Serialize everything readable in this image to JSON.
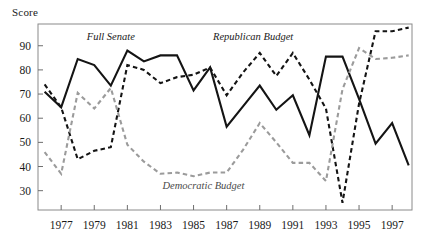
{
  "chart_data": {
    "type": "line",
    "title": "",
    "ylabel": "Score",
    "xlabel": "",
    "ylim": [
      22,
      99
    ],
    "xlim": [
      1975.6,
      1998.2
    ],
    "yticks": [
      30,
      40,
      50,
      60,
      70,
      80,
      90
    ],
    "xticks": [
      1977,
      1979,
      1981,
      1983,
      1985,
      1987,
      1989,
      1991,
      1993,
      1995,
      1997
    ],
    "xtick_labels": [
      "1977",
      "1979",
      "1981",
      "1983",
      "1985",
      "1987",
      "1989",
      "1991",
      "1993",
      "1995",
      "1997"
    ],
    "ytick_labels": [
      "30",
      "40",
      "50",
      "60",
      "70",
      "80",
      "90"
    ],
    "grid": false,
    "legend": "inline-annotations",
    "x": [
      1976,
      1977,
      1978,
      1979,
      1980,
      1981,
      1982,
      1983,
      1984,
      1985,
      1986,
      1987,
      1988,
      1989,
      1990,
      1991,
      1992,
      1993,
      1994,
      1995,
      1996,
      1997,
      1998
    ],
    "series": [
      {
        "name": "Full Senate",
        "style": "solid",
        "color": "#141414",
        "label_x": 1980.0,
        "label_y": 92.5,
        "values": [
          71,
          64.5,
          84.5,
          82,
          73.5,
          88,
          83.5,
          86,
          86,
          71.5,
          81,
          56.5,
          65,
          73.5,
          63.5,
          69.5,
          53,
          85.5,
          85.5,
          68,
          49.5,
          58,
          40.5
        ]
      },
      {
        "name": "Republican Budget",
        "style": "dashed",
        "color": "#141414",
        "label_x": 1988.6,
        "label_y": 92.5,
        "values": [
          74,
          64.5,
          43,
          46.5,
          48,
          82,
          80,
          74.5,
          77,
          78,
          81,
          69.5,
          79,
          87,
          77.5,
          87,
          76,
          64,
          25,
          66,
          96,
          96,
          97.5
        ]
      },
      {
        "name": "Democratic Budget",
        "style": "dashed",
        "color": "#9b9b9b",
        "label_x": 1985.6,
        "label_y": 30.5,
        "values": [
          46,
          37,
          70.5,
          64,
          72.5,
          49,
          42,
          37,
          37.5,
          36,
          37.5,
          37.5,
          47,
          58,
          50,
          41.5,
          41.5,
          34,
          72,
          89,
          84.5,
          85,
          86
        ]
      }
    ]
  }
}
